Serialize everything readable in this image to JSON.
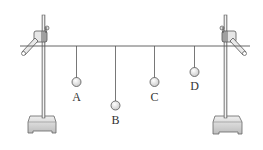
{
  "diagram": {
    "pendulums": [
      {
        "label": "A",
        "relative_length": "medium"
      },
      {
        "label": "B",
        "relative_length": "long"
      },
      {
        "label": "C",
        "relative_length": "medium"
      },
      {
        "label": "D",
        "relative_length": "short"
      }
    ],
    "colors": {
      "line": "#555555",
      "bob_fill": "#eeeeee",
      "base_fill": "#d8d8d8"
    }
  }
}
